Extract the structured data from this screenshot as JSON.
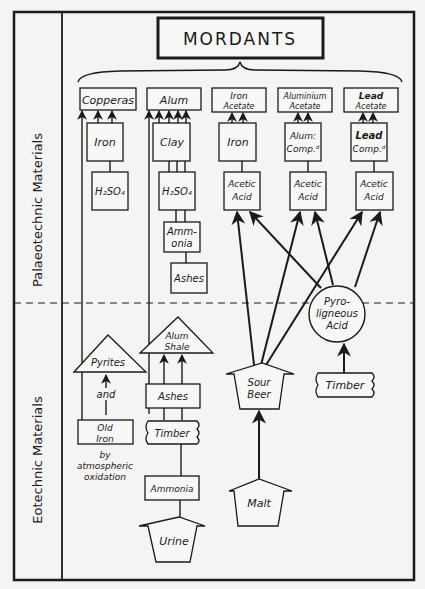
{
  "title": "MORDANTS",
  "side_labels": {
    "top": "Palaeotechnic Materials",
    "bottom": "Eotechnic Materials"
  },
  "mordants": [
    {
      "id": "copperas",
      "label": [
        "Copperas"
      ]
    },
    {
      "id": "alum",
      "label": [
        "Alum"
      ]
    },
    {
      "id": "iron_acetate",
      "label": [
        "Iron",
        "Acetate"
      ]
    },
    {
      "id": "aluminium_acetate",
      "label": [
        "Aluminium",
        "Acetate"
      ]
    },
    {
      "id": "lead_acetate",
      "label": [
        "Lead",
        "Acetate"
      ]
    }
  ],
  "palaeotechnic_nodes": {
    "iron1": "Iron",
    "h2so4_1": "H₂SO₄",
    "clay": "Clay",
    "h2so4_2": "H₂SO₄",
    "ammonia1": [
      "Amm-",
      "onia"
    ],
    "ashes1": "Ashes",
    "iron2": "Iron",
    "alum_comp": [
      "Alum:",
      "Comp.ᵈ"
    ],
    "lead_comp": [
      "Lead",
      "Comp.ᵈ"
    ],
    "acetic1": [
      "Acetic",
      "Acid"
    ],
    "acetic2": [
      "Acetic",
      "Acid"
    ],
    "acetic3": [
      "Acetic",
      "Acid"
    ],
    "pyroligneous": [
      "Pyro-",
      "ligneous",
      "Acid"
    ]
  },
  "eotechnic_nodes": {
    "pyrites": "Pyrites",
    "and": "and",
    "old_iron": [
      "Old",
      "Iron"
    ],
    "oxidation_note": [
      "by",
      "atmospheric",
      "oxidation"
    ],
    "alum_shale": [
      "Alum",
      "Shale"
    ],
    "ashes2": "Ashes",
    "timber1": "Timber",
    "ammonia2": "Ammonia",
    "urine": "Urine",
    "sour_beer": [
      "Sour",
      "Beer"
    ],
    "malt": "Malt",
    "timber2": "Timber"
  },
  "colors": {
    "ink": "#1a1a1a",
    "paper": "#f4f4f2"
  }
}
